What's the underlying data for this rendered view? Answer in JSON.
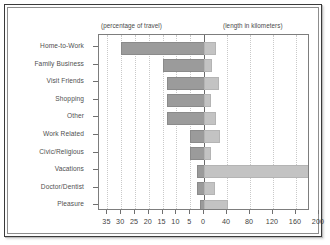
{
  "chart_data": {
    "type": "bar",
    "orientation": "horizontal",
    "style": "bidirectional-back-to-back",
    "title": "",
    "subtitle": "",
    "categories": [
      "Home-to-Work",
      "Family Business",
      "Visit Friends",
      "Shopping",
      "Other",
      "Work Related",
      "Civic/Religious",
      "Vacations",
      "Doctor/Dentist",
      "Pleasure"
    ],
    "series": [
      {
        "name": "percentage of travel",
        "side": "left",
        "units": "percent",
        "color": "#9b9b9b",
        "values": [
          30,
          15,
          13.5,
          13.5,
          13.5,
          5,
          5,
          2.5,
          2.5,
          1.5
        ]
      },
      {
        "name": "length in kilometers",
        "side": "right",
        "units": "kilometers",
        "color": "#c3c3c3",
        "values": [
          18,
          10,
          22,
          8,
          18,
          24,
          9,
          180,
          16,
          38
        ]
      }
    ],
    "left_header": "(percentage of travel)",
    "right_header": "(length in kilometers)",
    "xlabel": "",
    "ylabel": "",
    "left_axis": {
      "ticks": [
        35,
        30,
        25,
        20,
        15,
        10,
        5,
        0
      ],
      "tick_labels": [
        "35",
        "30",
        "25",
        "20",
        "15",
        "10",
        "5",
        "0"
      ],
      "min": 0,
      "max": 35,
      "direction": "reversed"
    },
    "right_axis": {
      "ticks": [
        0,
        40,
        80,
        120,
        160,
        200
      ],
      "tick_labels": [
        "0",
        "40",
        "80",
        "120",
        "160",
        "200"
      ],
      "min": 0,
      "max": 200,
      "direction": "normal"
    },
    "grid": true,
    "grid_style": "dotted-vertical",
    "legend": "none"
  },
  "geometry": {
    "zero_x": 105,
    "left_px_per_unit": 2.76,
    "right_px_per_unit": 0.575,
    "row_height": 17.6,
    "bar_height": 11,
    "first_row_center": 12
  }
}
